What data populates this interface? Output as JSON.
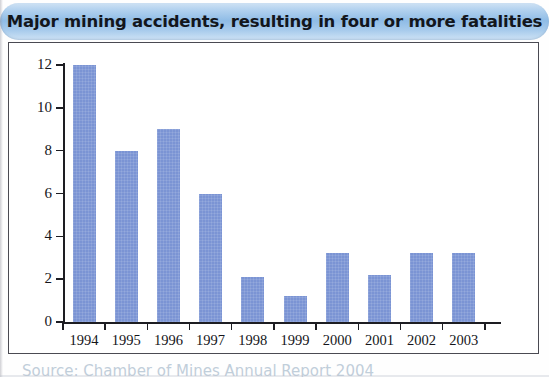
{
  "title": {
    "text": "Major mining accidents, resulting in four or more fatalities"
  },
  "caption": {
    "text": "Source: Chamber of Mines Annual Report 2004"
  },
  "colors": {
    "bar": "#7b94d4",
    "banner_light": "#cfe2f4",
    "banner_mid": "#8fbce6",
    "axis": "#1d1d22",
    "frame": "#4a4a52"
  },
  "chart_data": {
    "type": "bar",
    "title": "Major mining accidents, resulting in four or more fatalities",
    "xlabel": "",
    "ylabel": "",
    "categories": [
      "1994",
      "1995",
      "1996",
      "1997",
      "1998",
      "1999",
      "2000",
      "2001",
      "2002",
      "2003"
    ],
    "values": [
      12,
      8,
      9,
      6,
      2.1,
      1.2,
      3.2,
      2.2,
      3.2,
      3.2
    ],
    "ylim": [
      0,
      12
    ],
    "yticks": [
      0,
      2,
      4,
      6,
      8,
      10,
      12
    ],
    "ytick_labels": [
      "0",
      "2",
      "4",
      "6",
      "8",
      "10",
      "12"
    ],
    "grid": false,
    "legend": false
  }
}
